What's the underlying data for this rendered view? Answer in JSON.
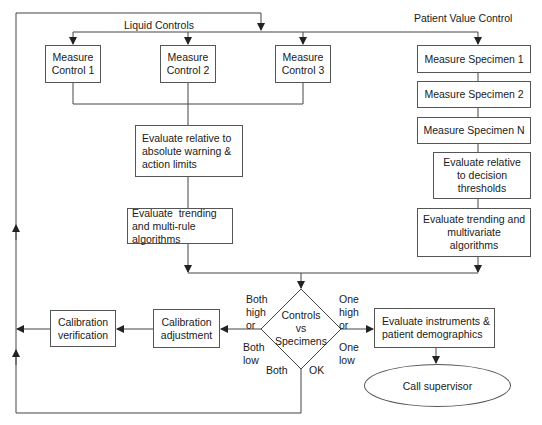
{
  "headers": {
    "liquid_controls": "Liquid Controls",
    "patient_value_control": "Patient Value Control"
  },
  "controls": [
    {
      "line1": "Measure",
      "line2": "Control 1"
    },
    {
      "line1": "Measure",
      "line2": "Control 2"
    },
    {
      "line1": "Measure",
      "line2": "Control 3"
    }
  ],
  "control_eval": {
    "absolute": "Evaluate relative to absolute warning & action limits",
    "trending": "Evaluate  trending and multi-rule algorithms"
  },
  "specimens": [
    {
      "label": "Measure Specimen 1"
    },
    {
      "label": "Measure Specimen 2"
    },
    {
      "label": "Measure Specimen N"
    }
  ],
  "specimen_eval": {
    "decision": "Evaluate relative to decision thresholds",
    "trending": "Evaluate trending and multivariate algorithms"
  },
  "decision": {
    "line1": "Controls",
    "line2": "vs",
    "line3": "Specimens",
    "left_top": "Both\nhigh\nor",
    "left_bottom": "Both\nlow",
    "right_top": "One\nhigh\nor",
    "right_bottom": "One\nlow",
    "bottom_left": "Both",
    "bottom_right": "OK"
  },
  "calibration": {
    "adjustment": "Calibration adjustment",
    "verification": "Calibration verification"
  },
  "instruments": "Evaluate instruments & patient demographics",
  "supervisor": "Call supervisor"
}
